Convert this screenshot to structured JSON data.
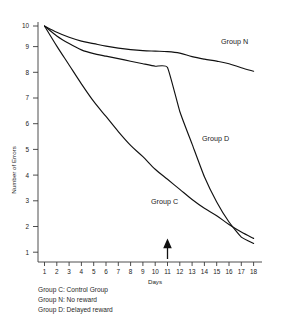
{
  "figure": {
    "background_color": "#ffffff",
    "line_color": "#111111",
    "axis_color": "#3a3a3a"
  },
  "axes": {
    "y_title": "Number of Errors",
    "x_title": "Days",
    "y_ticks": [
      "1",
      "2",
      "3",
      "4",
      "5",
      "6",
      "7",
      "8",
      "9",
      "10"
    ],
    "x_ticks": [
      "1",
      "2",
      "3",
      "4",
      "5",
      "6",
      "7",
      "8",
      "9",
      "10",
      "11",
      "12",
      "13",
      "14",
      "15",
      "16",
      "17",
      "18"
    ]
  },
  "series_labels": {
    "group_n": "Group N",
    "group_d": "Group D",
    "group_c": "Group C"
  },
  "annotation": {
    "arrow_day": "11",
    "arrow_description": "up-arrow-marker"
  },
  "legend": {
    "lines": [
      "Group C: Control Group",
      "Group N: No reward",
      "Group D: Delayed reward"
    ]
  },
  "chart_data": {
    "type": "line",
    "title": "",
    "xlabel": "Days",
    "ylabel": "Number of Errors",
    "xlim": [
      1,
      18
    ],
    "ylim": [
      1,
      10
    ],
    "grid": false,
    "legend_position": "below-plot-left",
    "x": [
      1,
      2,
      3,
      4,
      5,
      6,
      7,
      8,
      9,
      10,
      11,
      12,
      13,
      14,
      15,
      16,
      17,
      18
    ],
    "annotations": [
      {
        "type": "arrow",
        "x": 11,
        "y": 1,
        "text": "reward introduced for Group D"
      }
    ],
    "series": [
      {
        "name": "Group N",
        "label": "Group N",
        "description": "No reward",
        "values": [
          10.0,
          9.75,
          9.55,
          9.4,
          9.3,
          9.2,
          9.12,
          9.06,
          9.02,
          9.0,
          8.98,
          8.92,
          8.78,
          8.68,
          8.6,
          8.5,
          8.34,
          8.2
        ]
      },
      {
        "name": "Group D",
        "label": "Group D",
        "description": "Delayed reward",
        "values": [
          10.0,
          9.6,
          9.3,
          9.05,
          8.9,
          8.8,
          8.7,
          8.6,
          8.5,
          8.4,
          8.35,
          6.6,
          5.3,
          4.0,
          3.0,
          2.2,
          1.6,
          1.35
        ]
      },
      {
        "name": "Group C",
        "label": "Group C",
        "description": "Control Group",
        "values": [
          10.0,
          9.2,
          8.45,
          7.7,
          7.0,
          6.4,
          5.8,
          5.25,
          4.8,
          4.3,
          3.9,
          3.5,
          3.1,
          2.75,
          2.45,
          2.1,
          1.8,
          1.55
        ]
      }
    ]
  }
}
